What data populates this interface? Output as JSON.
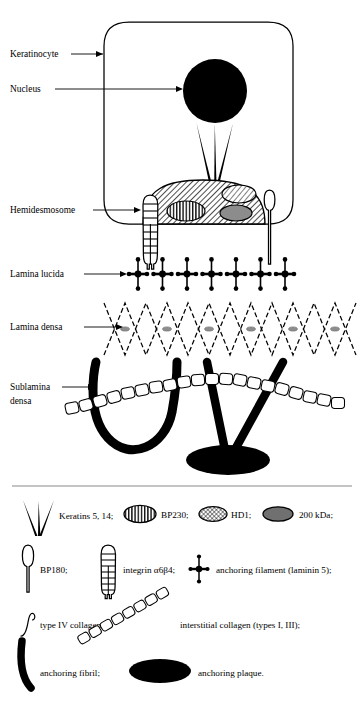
{
  "figure": {
    "background_color": "#ffffff",
    "ink_color": "#000000",
    "gray_fill": "#808080",
    "divider_color": "#808080"
  },
  "diagram_labels": [
    {
      "id": "keratinocyte",
      "text": "Keratinocyte",
      "x": 10,
      "y": 57,
      "leader": true
    },
    {
      "id": "nucleus",
      "text": "Nucleus",
      "x": 10,
      "y": 92,
      "leader": true
    },
    {
      "id": "hemidesmosome",
      "text": "Hemidesmosome",
      "x": 10,
      "y": 213,
      "leader": true
    },
    {
      "id": "lamina-lucida",
      "text": "Lamina lucida",
      "x": 10,
      "y": 277,
      "leader": true
    },
    {
      "id": "lamina-densa",
      "text": "Lamina densa",
      "x": 10,
      "y": 330,
      "leader": true
    },
    {
      "id": "sublamina-densa-line1",
      "text": "Sublamina",
      "x": 10,
      "y": 389,
      "leader": true
    },
    {
      "id": "sublamina-densa-line2",
      "text": "densa",
      "x": 10,
      "y": 403,
      "leader": false
    }
  ],
  "legend": {
    "rows": [
      {
        "items": [
          {
            "id": "keratins",
            "icon": "keratin-filaments-icon",
            "label": "Keratins 5, 14;"
          },
          {
            "id": "bp230",
            "icon": "bp230-ellipse-icon",
            "label": "BP230;"
          },
          {
            "id": "hd1",
            "icon": "hd1-ellipse-icon",
            "label": "HD1;"
          },
          {
            "id": "kda200",
            "icon": "200kda-ellipse-icon",
            "label": "200 kDa;"
          }
        ]
      },
      {
        "items": [
          {
            "id": "bp180",
            "icon": "bp180-icon",
            "label": "BP180;"
          },
          {
            "id": "integrin",
            "icon": "integrin-a6b4-icon",
            "label": "integrin α6β4;"
          },
          {
            "id": "anchoring-filament",
            "icon": "anchoring-filament-icon",
            "label": "anchoring filament (laminin 5);"
          }
        ]
      },
      {
        "items": [
          {
            "id": "type-iv-collagen",
            "icon": "type-iv-collagen-icon",
            "label": "type IV collagen;"
          },
          {
            "id": "interstitial-collagen",
            "icon": "interstitial-collagen-icon",
            "label": "interstitial collagen (types I, III);"
          }
        ]
      },
      {
        "items": [
          {
            "id": "anchoring-fibril",
            "icon": "anchoring-fibril-icon",
            "label": "anchoring fibril;"
          },
          {
            "id": "anchoring-plaque",
            "icon": "anchoring-plaque-icon",
            "label": "anchoring plaque."
          }
        ]
      }
    ]
  },
  "structures": {
    "anchoring_filament_count": 7,
    "keratin_filament_count": 3,
    "lamina_densa_zigzag_periods": 6,
    "hemidesmosome_plaques": [
      "bp230-ellipse",
      "hd1-ellipse",
      "200kda-ellipse"
    ]
  }
}
